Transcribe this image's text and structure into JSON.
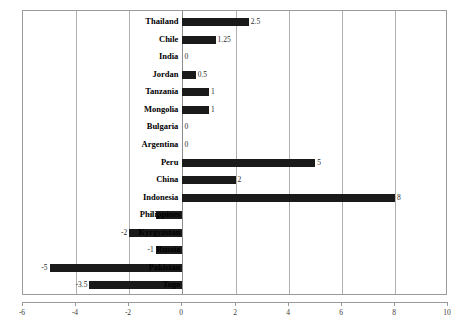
{
  "chart_data": {
    "type": "bar",
    "orientation": "horizontal",
    "title": "",
    "subtitle": "",
    "xlabel": "",
    "ylabel": "",
    "xlim": [
      -6,
      10
    ],
    "ylim": null,
    "grid": true,
    "grid_axis": "x",
    "legend": null,
    "legend_position": "none",
    "xticks": [
      -6,
      -4,
      -2,
      0,
      2,
      4,
      6,
      8,
      10
    ],
    "xtick_labels": [
      "-6",
      "-4",
      "-2",
      "0",
      "2",
      "4",
      "6",
      "8",
      "10"
    ],
    "bar_color": "#1a1a1a",
    "categories": [
      "Thailand",
      "Chile",
      "India",
      "Jordan",
      "Tanzania",
      "Mongolia",
      "Bulgaria",
      "Argentina",
      "Peru",
      "China",
      "Indonesia",
      "Philippines",
      "Kyrgyzstan",
      "Russia",
      "Pakistan",
      "Togo"
    ],
    "values": [
      2.5,
      1.25,
      0,
      0.5,
      1,
      1,
      0,
      0,
      5,
      2,
      8,
      -1,
      -2,
      -1,
      -5,
      -3.5
    ],
    "data_labels": [
      "2.5",
      "1.25",
      "0",
      "0.5",
      "1",
      "1",
      "0",
      "0",
      "5",
      "2",
      "8",
      "-1",
      "-2",
      "-1",
      "-5",
      "-3.5"
    ]
  },
  "axis": {
    "x_min_label": "-6",
    "x_max_label": "10"
  }
}
